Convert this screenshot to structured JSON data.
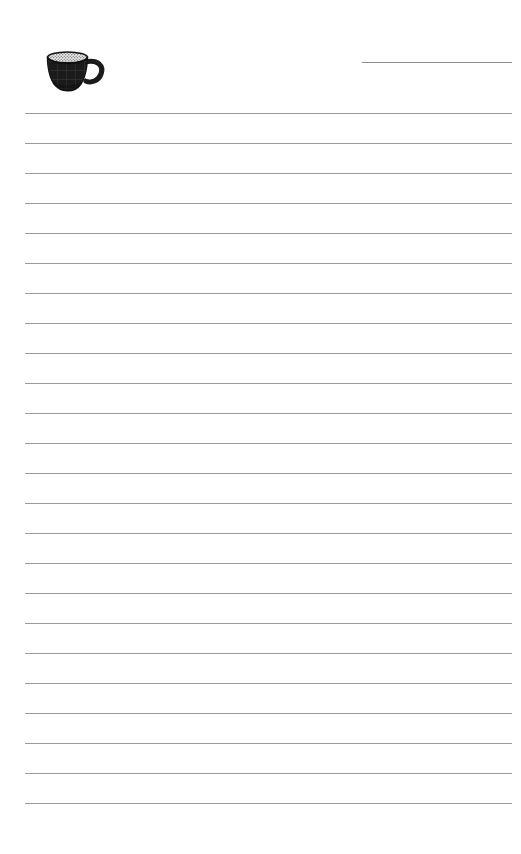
{
  "page": {
    "background_color": "#ffffff",
    "width": 521,
    "height": 854,
    "title": ""
  },
  "header": {
    "illustration": {
      "icon": "coffee-cup-icon",
      "description": "filled dark coffee cup with handle and light foam rim",
      "body_color": "#1d1d1d",
      "foam_color": "#e8e8e8",
      "rim_color": "#f2f2f2"
    },
    "date_field": {
      "label": "",
      "value": "",
      "rule_color": "#8f8f8f",
      "rule_x": 362,
      "rule_y": 62,
      "rule_width": 150
    }
  },
  "ruled_area": {
    "line_color": "#9a9a9a",
    "line_thickness": 1,
    "line_left": 25,
    "line_width": 487,
    "first_line_y": 113,
    "line_spacing": 30,
    "line_count": 24,
    "lines": [
      {
        "index": 1,
        "y": 113,
        "text": ""
      },
      {
        "index": 2,
        "y": 143,
        "text": ""
      },
      {
        "index": 3,
        "y": 173,
        "text": ""
      },
      {
        "index": 4,
        "y": 203,
        "text": ""
      },
      {
        "index": 5,
        "y": 233,
        "text": ""
      },
      {
        "index": 6,
        "y": 263,
        "text": ""
      },
      {
        "index": 7,
        "y": 293,
        "text": ""
      },
      {
        "index": 8,
        "y": 323,
        "text": ""
      },
      {
        "index": 9,
        "y": 353,
        "text": ""
      },
      {
        "index": 10,
        "y": 383,
        "text": ""
      },
      {
        "index": 11,
        "y": 413,
        "text": ""
      },
      {
        "index": 12,
        "y": 443,
        "text": ""
      },
      {
        "index": 13,
        "y": 473,
        "text": ""
      },
      {
        "index": 14,
        "y": 503,
        "text": ""
      },
      {
        "index": 15,
        "y": 533,
        "text": ""
      },
      {
        "index": 16,
        "y": 563,
        "text": ""
      },
      {
        "index": 17,
        "y": 593,
        "text": ""
      },
      {
        "index": 18,
        "y": 623,
        "text": ""
      },
      {
        "index": 19,
        "y": 653,
        "text": ""
      },
      {
        "index": 20,
        "y": 683,
        "text": ""
      },
      {
        "index": 21,
        "y": 713,
        "text": ""
      },
      {
        "index": 22,
        "y": 743,
        "text": ""
      },
      {
        "index": 23,
        "y": 773,
        "text": ""
      },
      {
        "index": 24,
        "y": 803,
        "text": ""
      }
    ]
  },
  "footer": {
    "text": ""
  }
}
